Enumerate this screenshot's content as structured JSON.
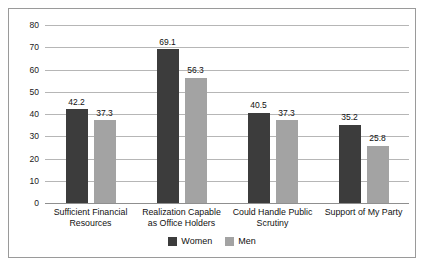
{
  "chart_data": {
    "type": "bar",
    "title": "",
    "subtitle": "",
    "xlabel": "",
    "ylabel": "",
    "ylim": [
      0,
      80
    ],
    "ytick_step": 10,
    "yticks": [
      "80",
      "70",
      "60",
      "50",
      "40",
      "30",
      "20",
      "10",
      "0"
    ],
    "grid": true,
    "legend_position": "bottom",
    "categories": [
      "Sufficient Financial Resources",
      "Realization Capable as Office Holders",
      "Could Handle Public Scrutiny",
      "Support of My Party"
    ],
    "category_lines": [
      [
        "Sufficient Financial",
        "Resources"
      ],
      [
        "Realization Capable",
        "as Office Holders"
      ],
      [
        "Could Handle Public",
        "Scrutiny"
      ],
      [
        "Support of My Party"
      ]
    ],
    "series": [
      {
        "name": "Women",
        "color": "#3c3c3c",
        "values": [
          42.2,
          69.1,
          40.5,
          35.2
        ],
        "labels": [
          "42.2",
          "69.1",
          "40.5",
          "35.2"
        ]
      },
      {
        "name": "Men",
        "color": "#a3a3a3",
        "values": [
          37.3,
          56.3,
          37.3,
          25.8
        ],
        "labels": [
          "37.3",
          "56.3",
          "37.3",
          "25.8"
        ]
      }
    ]
  },
  "legend": {
    "items": [
      {
        "label": "Women",
        "color": "#3c3c3c"
      },
      {
        "label": "Men",
        "color": "#a3a3a3"
      }
    ]
  }
}
